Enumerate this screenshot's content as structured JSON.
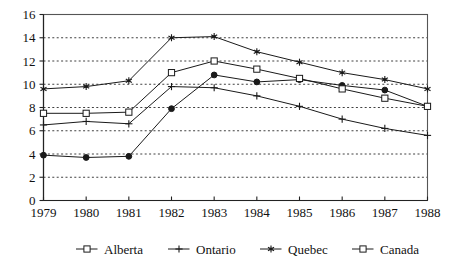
{
  "chart_data": {
    "type": "line",
    "title": "",
    "xlabel": "",
    "ylabel": "",
    "categories": [
      "1979",
      "1980",
      "1981",
      "1982",
      "1983",
      "1984",
      "1985",
      "1986",
      "1987",
      "1988"
    ],
    "x_tick_labels": [
      "1979",
      "1980",
      "1981",
      "1982",
      "1983",
      "1984",
      "1985",
      "1986",
      "1987",
      "1988"
    ],
    "y_tick_labels": [
      "0",
      "2",
      "4",
      "6",
      "8",
      "10",
      "12",
      "14",
      "16"
    ],
    "y_ticks": [
      0,
      2,
      4,
      6,
      8,
      10,
      12,
      14,
      16
    ],
    "ylim": [
      0,
      16
    ],
    "grid": "horizontal-dotted",
    "legend_position": "bottom",
    "series": [
      {
        "name": "Alberta",
        "marker": "open-square",
        "plot_marker": "filled-circle",
        "values": [
          3.9,
          3.7,
          3.8,
          7.9,
          10.8,
          10.2,
          10.4,
          9.9,
          9.5,
          8.1
        ]
      },
      {
        "name": "Ontario",
        "marker": "plus",
        "plot_marker": "plus",
        "values": [
          6.5,
          6.8,
          6.6,
          9.8,
          9.7,
          9.0,
          8.1,
          7.0,
          6.2,
          5.6
        ]
      },
      {
        "name": "Quebec",
        "marker": "asterisk",
        "plot_marker": "asterisk",
        "values": [
          9.6,
          9.8,
          10.3,
          14.0,
          14.1,
          12.8,
          11.9,
          11.0,
          10.4,
          9.6
        ]
      },
      {
        "name": "Canada",
        "marker": "open-square",
        "plot_marker": "open-square",
        "values": [
          7.5,
          7.5,
          7.6,
          11.0,
          12.0,
          11.3,
          10.5,
          9.6,
          8.8,
          8.1
        ]
      }
    ]
  },
  "legend": {
    "items": [
      {
        "label": "Alberta"
      },
      {
        "label": "Ontario"
      },
      {
        "label": "Quebec"
      },
      {
        "label": "Canada"
      }
    ]
  },
  "colors": {
    "ink": "#1a1a1a",
    "grid": "#2b2b2b",
    "frame": "#555555",
    "background": "#ffffff"
  }
}
